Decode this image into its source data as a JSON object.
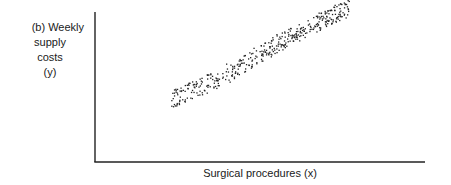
{
  "chart_data": {
    "type": "scatter",
    "title": "",
    "panel_label": "(b)",
    "ylabel": "Weekly supply costs (y)",
    "ylabel_lines": [
      "(b) Weekly",
      "supply",
      "costs",
      "(y)"
    ],
    "xlabel": "Surgical procedures (x)",
    "xticks": [],
    "yticks": [],
    "grid": false,
    "legend": null,
    "trend": {
      "band_start_px": [
        172,
        98
      ],
      "band_end_px": [
        350,
        8
      ],
      "band_halfwidth_px": 9,
      "approx_points": 420
    },
    "axis_px": {
      "x0": 95,
      "x1": 425,
      "y0": 162,
      "y1": 12
    },
    "point_color": "#222222"
  }
}
